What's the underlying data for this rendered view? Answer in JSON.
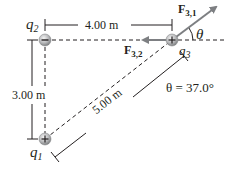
{
  "charges": {
    "q1": {
      "symbol": "q",
      "subscript": "1",
      "sign": "+"
    },
    "q2": {
      "symbol": "q",
      "subscript": "2",
      "sign": "−"
    },
    "q3": {
      "symbol": "q",
      "subscript": "3",
      "sign": "+"
    }
  },
  "forces": {
    "f31": {
      "symbol": "F",
      "subscript": "3,1"
    },
    "f32": {
      "symbol": "F",
      "subscript": "3,2"
    }
  },
  "dimensions": {
    "horizontal": "4.00 m",
    "vertical": "3.00 m",
    "diagonal": "5.00 m"
  },
  "angle": {
    "symbol": "θ",
    "equation": "θ = 37.0°"
  },
  "colors": {
    "force_arrow": "#7d7f82",
    "line": "#231f20",
    "charge_fill": "#b8b9bb"
  }
}
